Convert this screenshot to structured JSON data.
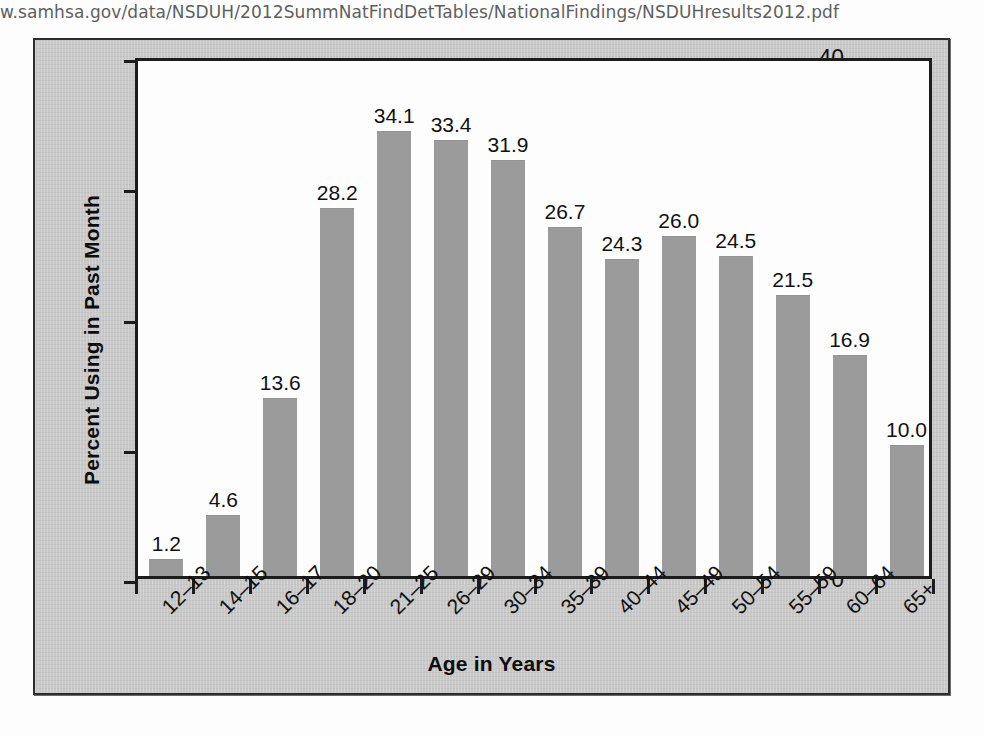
{
  "page": {
    "source_url_text": "w.samhsa.gov/data/NSDUH/2012SummNatFindDetTables/NationalFindings/NSDUHresults2012.pdf"
  },
  "colors": {
    "bar_fill": "#9b9b9b",
    "panel_background": "#c8c8c8",
    "plot_background": "#fdfdfd",
    "axis": "#1c1c1c",
    "text": "#111111"
  },
  "chart_data": {
    "type": "bar",
    "title": "",
    "xlabel": "Age in Years",
    "ylabel": "Percent Using in Past Month",
    "categories": [
      "12–13",
      "14–15",
      "16–17",
      "18–20",
      "21–25",
      "26–29",
      "30–34",
      "35–39",
      "40–44",
      "45–49",
      "50–54",
      "55–59",
      "60–64",
      "65+"
    ],
    "values": [
      1.2,
      4.6,
      13.6,
      28.2,
      34.1,
      33.4,
      31.9,
      26.7,
      24.3,
      26.0,
      24.5,
      21.5,
      16.9,
      10.0
    ],
    "value_labels": [
      "1.2",
      "4.6",
      "13.6",
      "28.2",
      "34.1",
      "33.4",
      "31.9",
      "26.7",
      "24.3",
      "26.0",
      "24.5",
      "21.5",
      "16.9",
      "10.0"
    ],
    "ylim": [
      0,
      40
    ],
    "yticks": [
      0,
      10,
      20,
      30,
      40
    ],
    "ytick_labels": [
      "0",
      "10",
      "20",
      "30",
      "40"
    ],
    "grid": false,
    "legend": false,
    "legend_position": "none"
  }
}
